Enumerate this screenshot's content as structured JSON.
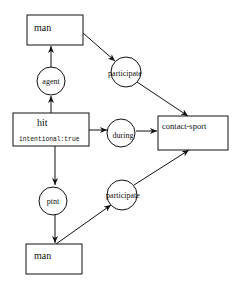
{
  "diagram": {
    "type": "conceptual-graph",
    "concepts": {
      "man_top": {
        "label": "man"
      },
      "hit": {
        "label": "hit",
        "attribute": "intentional:true"
      },
      "contact_sport": {
        "label": "contact-sport"
      },
      "man_bottom": {
        "label": "man"
      }
    },
    "relations": {
      "agent": {
        "label": "agent"
      },
      "participate_top": {
        "label": "participate"
      },
      "during": {
        "label": "during"
      },
      "ptnt": {
        "label": "ptnt"
      },
      "participate_bottom": {
        "label": "participate"
      }
    },
    "edges": [
      {
        "from": "hit",
        "to": "agent"
      },
      {
        "from": "agent",
        "to": "man_top"
      },
      {
        "from": "man_top",
        "to": "participate_top"
      },
      {
        "from": "participate_top",
        "to": "contact_sport"
      },
      {
        "from": "hit",
        "to": "during"
      },
      {
        "from": "during",
        "to": "contact_sport"
      },
      {
        "from": "hit",
        "to": "ptnt"
      },
      {
        "from": "ptnt",
        "to": "man_bottom"
      },
      {
        "from": "man_bottom",
        "to": "participate_bottom"
      },
      {
        "from": "participate_bottom",
        "to": "contact_sport"
      }
    ],
    "colors": {
      "stroke": "#111111",
      "background": "#ffffff"
    }
  }
}
